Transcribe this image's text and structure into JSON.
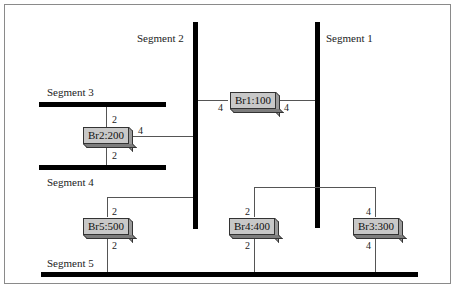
{
  "diagram": {
    "type": "network-topology",
    "segments": [
      {
        "id": "seg1",
        "label": "Segment 1",
        "orientation": "vertical"
      },
      {
        "id": "seg2",
        "label": "Segment 2",
        "orientation": "vertical"
      },
      {
        "id": "seg3",
        "label": "Segment 3",
        "orientation": "horizontal"
      },
      {
        "id": "seg4",
        "label": "Segment 4",
        "orientation": "horizontal"
      },
      {
        "id": "seg5",
        "label": "Segment 5",
        "orientation": "horizontal"
      }
    ],
    "bridges": [
      {
        "id": "br1",
        "label": "Br1:100",
        "ports": [
          {
            "port": "4",
            "segment": "Segment 2"
          },
          {
            "port": "4",
            "segment": "Segment 1"
          }
        ]
      },
      {
        "id": "br2",
        "label": "Br2:200",
        "ports": [
          {
            "port": "2",
            "segment": "Segment 3"
          },
          {
            "port": "2",
            "segment": "Segment 4"
          },
          {
            "port": "4",
            "segment": "Segment 2"
          }
        ]
      },
      {
        "id": "br3",
        "label": "Br3:300",
        "ports": [
          {
            "port": "4",
            "segment": "Segment 1"
          },
          {
            "port": "4",
            "segment": "Segment 5"
          }
        ]
      },
      {
        "id": "br4",
        "label": "Br4:400",
        "ports": [
          {
            "port": "2",
            "segment": "Segment 1"
          },
          {
            "port": "2",
            "segment": "Segment 5"
          }
        ]
      },
      {
        "id": "br5",
        "label": "Br5:500",
        "ports": [
          {
            "port": "2",
            "segment": "Segment 2"
          },
          {
            "port": "2",
            "segment": "Segment 5"
          }
        ]
      }
    ],
    "port_labels": {
      "br1_left": "4",
      "br1_right": "4",
      "br2_top": "2",
      "br2_bottom": "2",
      "br2_right": "4",
      "br3_top": "4",
      "br3_bottom": "4",
      "br4_top": "2",
      "br4_bottom": "2",
      "br5_top": "2",
      "br5_bottom": "2"
    }
  }
}
